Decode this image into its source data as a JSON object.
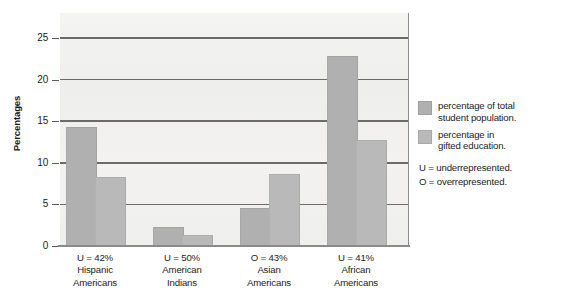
{
  "chart_data": {
    "type": "bar",
    "title": "",
    "subtitle": "",
    "xlabel": "",
    "ylabel": "Percentages",
    "ylim": [
      0,
      28
    ],
    "yticks": [
      0,
      5,
      10,
      15,
      20,
      25
    ],
    "grid": true,
    "legend_position": "right",
    "categories": [
      "U = 42%\nHispanic\nAmericans",
      "U = 50%\nAmerican\nIndians",
      "O = 43%\nAsian\nAmericans",
      "U = 41%\nAfrican\nAmericans"
    ],
    "category_details": [
      {
        "status": "U = 42%",
        "line1": "Hispanic",
        "line2": "Americans"
      },
      {
        "status": "U = 50%",
        "line1": "American",
        "line2": "Indians"
      },
      {
        "status": "O = 43%",
        "line1": "Asian",
        "line2": "Americans"
      },
      {
        "status": "U = 41%",
        "line1": "African",
        "line2": "Americans"
      }
    ],
    "series": [
      {
        "name": "percentage of total student population.",
        "name_line1": "percentage of total",
        "name_line2": "student population.",
        "color": "#b0b0b0",
        "values": [
          14.2,
          2.2,
          4.4,
          22.7
        ]
      },
      {
        "name": "percentage in gifted education.",
        "name_line1": "percentage in",
        "name_line2": "gifted education.",
        "color": "#b9b9b9",
        "values": [
          8.2,
          1.2,
          8.5,
          12.6
        ]
      }
    ],
    "annotations": [
      "U = underrepresented.",
      "O = overrepresented."
    ],
    "notes": {
      "underrepresented": "U = underrepresented.",
      "overrepresented": "O = overrepresented."
    },
    "colors": {
      "plot_background": "#f1f1ef",
      "gridline": "#6b6b6b",
      "axis": "#8a8a8a",
      "text": "#1b1b1b"
    }
  }
}
